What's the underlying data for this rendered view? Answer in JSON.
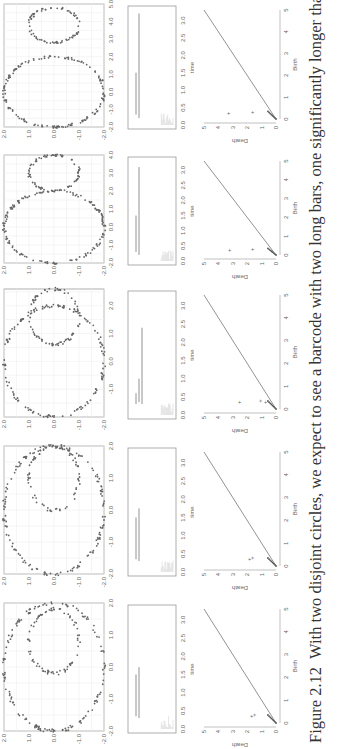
{
  "caption": {
    "label": "Figure 2.12",
    "text": "With two disjoint circles, we expect to see a barcode with two long bars, one significantly longer than the other to reflect the"
  },
  "axis_labels": {
    "barcode_x": "time",
    "pd_x": "Birth",
    "pd_y": "Death"
  },
  "chart_data": [
    {
      "type": "scatter",
      "panel": 1,
      "title": "",
      "xlim": [
        -2,
        2
      ],
      "ylim": [
        -2,
        2
      ],
      "xticks": [
        "-2.0",
        "-1.0",
        "0.0",
        "1.0",
        "2.0"
      ],
      "yticks": [
        "-2.0",
        "-1.0",
        "0.0",
        "1.0",
        "2.0"
      ],
      "circles": [
        {
          "cx": 0,
          "cy": 0,
          "r": 2
        },
        {
          "cx": 0.8,
          "cy": 0,
          "r": 1
        }
      ]
    },
    {
      "type": "scatter",
      "panel": 2,
      "xlim": [
        -2,
        2
      ],
      "ylim": [
        -2,
        2
      ],
      "xticks": [
        "-2.0",
        "-1.0",
        "0.0",
        "1.0",
        "2.0"
      ],
      "yticks": [
        "-2.0",
        "-1.0",
        "0.0",
        "1.0",
        "2.0"
      ],
      "circles": [
        {
          "cx": 0,
          "cy": 0,
          "r": 2
        },
        {
          "cx": 1.0,
          "cy": 0,
          "r": 1
        }
      ]
    },
    {
      "type": "scatter",
      "panel": 3,
      "xlim": [
        -2,
        2.6
      ],
      "ylim": [
        -2,
        2
      ],
      "xticks": [
        "-1.0",
        "0.0",
        "1.0",
        "2.0"
      ],
      "yticks": [
        "-2.0",
        "-1.0",
        "0.0",
        "1.0",
        "2.0"
      ],
      "circles": [
        {
          "cx": 0,
          "cy": 0,
          "r": 2
        },
        {
          "cx": 1.6,
          "cy": 0,
          "r": 1
        }
      ]
    },
    {
      "type": "scatter",
      "panel": 4,
      "xlim": [
        -2,
        4
      ],
      "ylim": [
        -2,
        2
      ],
      "xticks": [
        "-2.0",
        "-1.0",
        "0.0",
        "1.0",
        "2.0",
        "3.0",
        "4.0"
      ],
      "yticks": [
        "-2.0",
        "-1.0",
        "0.0",
        "1.0",
        "2.0"
      ],
      "circles": [
        {
          "cx": 0,
          "cy": 0,
          "r": 2
        },
        {
          "cx": 3,
          "cy": 0,
          "r": 1
        }
      ]
    },
    {
      "type": "scatter",
      "panel": 5,
      "xlim": [
        -2,
        5
      ],
      "ylim": [
        -2,
        2
      ],
      "xticks": [
        "-2.0",
        "-1.0",
        "0.0",
        "1.0",
        "2.0",
        "3.0",
        "4.0",
        "5.0"
      ],
      "yticks": [
        "-2.0",
        "-1.0",
        "0.0",
        "1.0",
        "2.0"
      ],
      "circles": [
        {
          "cx": 0,
          "cy": 0,
          "r": 2
        },
        {
          "cx": 3.8,
          "cy": 0,
          "r": 1
        }
      ]
    },
    {
      "type": "barcode",
      "panel": 1,
      "xlabel": "time",
      "xticks": [
        "0.0",
        "0.5",
        "1.0",
        "1.5",
        "2.0",
        "2.5",
        "3.0"
      ],
      "long_bars": [
        [
          0.35,
          1.5
        ],
        [
          0.3,
          1.7
        ]
      ]
    },
    {
      "type": "barcode",
      "panel": 2,
      "xlabel": "time",
      "xticks": [
        "0.0",
        "0.5",
        "1.0",
        "1.5",
        "2.0",
        "2.5",
        "3.0"
      ],
      "long_bars": [
        [
          0.35,
          1.5
        ],
        [
          0.3,
          1.75
        ]
      ]
    },
    {
      "type": "barcode",
      "panel": 3,
      "xlabel": "time",
      "xticks": [
        "0.0",
        "0.5",
        "1.0",
        "1.5",
        "2.0",
        "2.5",
        "3.0"
      ],
      "long_bars": [
        [
          0.3,
          0.6
        ],
        [
          0.35,
          1.0
        ],
        [
          0.3,
          2.4
        ]
      ]
    },
    {
      "type": "barcode",
      "panel": 4,
      "xlabel": "time",
      "xticks": [
        "0.0",
        "0.5",
        "1.0",
        "1.5",
        "2.0",
        "2.5",
        "3.0"
      ],
      "long_bars": [
        [
          0.3,
          1.5
        ],
        [
          0.2,
          3.1
        ]
      ]
    },
    {
      "type": "barcode",
      "panel": 5,
      "xlabel": "time",
      "xticks": [
        "0.0",
        "0.5",
        "1.0",
        "1.5",
        "2.0",
        "2.5",
        "3.0"
      ],
      "long_bars": [
        [
          0.3,
          1.5
        ],
        [
          0.2,
          3.2
        ]
      ]
    },
    {
      "type": "scatter",
      "subtype": "persistence_diagram",
      "panel": 1,
      "xlabel": "Birth",
      "ylabel": "Death",
      "xticks": [
        "0",
        "1",
        "2",
        "3",
        "4",
        "5"
      ],
      "yticks": [
        "0",
        "1",
        "2",
        "3",
        "4",
        "5"
      ],
      "points": [
        [
          0.35,
          1.4
        ],
        [
          0.3,
          1.6
        ]
      ]
    },
    {
      "type": "scatter",
      "subtype": "persistence_diagram",
      "panel": 2,
      "xlabel": "Birth",
      "ylabel": "Death",
      "xticks": [
        "0",
        "1",
        "2",
        "3",
        "4",
        "5"
      ],
      "yticks": [
        "0",
        "1",
        "2",
        "3",
        "4",
        "5"
      ],
      "points": [
        [
          0.35,
          1.5
        ],
        [
          0.3,
          1.75
        ]
      ]
    },
    {
      "type": "scatter",
      "subtype": "persistence_diagram",
      "panel": 3,
      "xlabel": "Birth",
      "ylabel": "Death",
      "xticks": [
        "0",
        "1",
        "2",
        "3",
        "4",
        "5"
      ],
      "yticks": [
        "0",
        "1",
        "2",
        "3",
        "4",
        "5"
      ],
      "points": [
        [
          0.3,
          0.6
        ],
        [
          0.35,
          1.0
        ],
        [
          0.3,
          2.4
        ]
      ]
    },
    {
      "type": "scatter",
      "subtype": "persistence_diagram",
      "panel": 4,
      "xlabel": "Birth",
      "ylabel": "Death",
      "xticks": [
        "0",
        "1",
        "2",
        "3",
        "4",
        "5"
      ],
      "yticks": [
        "0",
        "1",
        "2",
        "3",
        "4",
        "5"
      ],
      "points": [
        [
          0.3,
          1.5
        ],
        [
          0.25,
          3.1
        ]
      ]
    },
    {
      "type": "scatter",
      "subtype": "persistence_diagram",
      "panel": 5,
      "xlabel": "Birth",
      "ylabel": "Death",
      "xticks": [
        "0",
        "1",
        "2",
        "3",
        "4",
        "5"
      ],
      "yticks": [
        "0",
        "1",
        "2",
        "3",
        "4",
        "5"
      ],
      "points": [
        [
          0.3,
          1.5
        ],
        [
          0.25,
          3.2
        ]
      ]
    }
  ]
}
